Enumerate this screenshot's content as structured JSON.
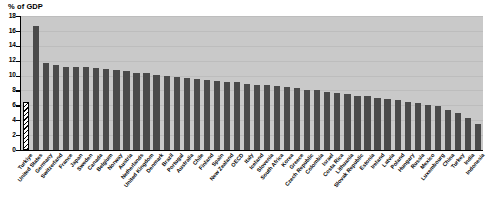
{
  "chart_data": {
    "type": "bar",
    "title": "",
    "ylabel": "% of GDP",
    "xlabel": "",
    "ylim": [
      0,
      18
    ],
    "ytick_values": [
      0,
      2,
      4,
      6,
      8,
      10,
      12,
      14,
      16,
      18
    ],
    "ytick_labels": [
      "0",
      "2",
      "4",
      "6",
      "8",
      "10",
      "12",
      "14",
      "16",
      "18"
    ],
    "grid": true,
    "grid_axis": "y",
    "legend": null,
    "bar_color": "#4a4a4a",
    "highlight_style": "hatched",
    "plot_background": "#c9c9c9",
    "categories": [
      "Turkiye",
      "United States",
      "Germany",
      "Switzerland",
      "France",
      "Japan",
      "Sweden",
      "Canada",
      "Belgium",
      "Norway",
      "Austria",
      "Netherlands",
      "United Kingdom",
      "Denmark",
      "Brazil",
      "Portugal",
      "Australia",
      "Chile",
      "Finland",
      "Spain",
      "New Zealand",
      "OECD",
      "Italy",
      "Iceland",
      "Slovenia",
      "South Africa",
      "Korea",
      "Greece",
      "Czech Republic",
      "Colombia",
      "Israel",
      "Costa Rica",
      "Lithuania",
      "Slovak Republic",
      "Estonia",
      "Ireland",
      "Latvia",
      "Poland",
      "Hungary",
      "Russia",
      "Mexico",
      "Luxembourg",
      "China",
      "Turkey",
      "India",
      "Indonesia"
    ],
    "values": [
      6.5,
      16.7,
      11.7,
      11.4,
      11.2,
      11.1,
      11.1,
      11.0,
      10.9,
      10.8,
      10.6,
      10.4,
      10.3,
      10.1,
      9.9,
      9.8,
      9.7,
      9.5,
      9.4,
      9.3,
      9.2,
      9.1,
      8.9,
      8.8,
      8.7,
      8.6,
      8.4,
      8.3,
      8.1,
      8.0,
      7.8,
      7.7,
      7.5,
      7.3,
      7.2,
      7.0,
      6.9,
      6.7,
      6.5,
      6.3,
      6.1,
      5.9,
      5.4,
      5.0,
      4.3,
      3.5
    ],
    "highlighted_index": 0
  }
}
